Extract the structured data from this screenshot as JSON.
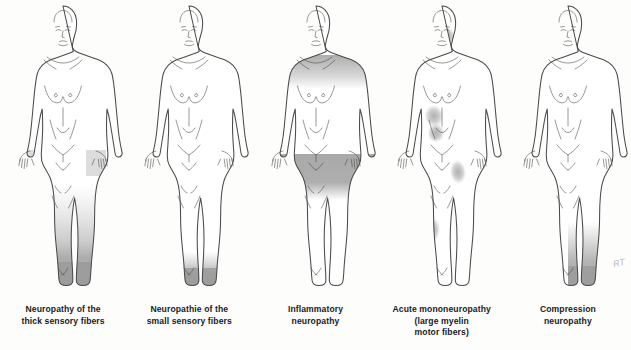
{
  "figure": {
    "background_color": "#fdfdfc",
    "outline_color": "#4a4a4a",
    "shade_color": "#9a9a9a",
    "signature": "RT"
  },
  "panels": [
    {
      "id": "thick-sensory-fibers",
      "caption_lines": [
        "Neuropathy of the",
        "thick sensory fibers"
      ],
      "pattern": "stocking-glove, symmetric distal",
      "regions": [
        "both hands",
        "both lower legs gradient",
        "both feet solid"
      ]
    },
    {
      "id": "small-sensory-fibers",
      "caption_lines": [
        "Neuropathie of the",
        "small sensory fibers"
      ],
      "pattern": "short stocking, symmetric distal",
      "regions": [
        "both feet",
        "both ankles"
      ]
    },
    {
      "id": "inflammatory-neuropathy",
      "caption_lines": [
        "Inflammatory",
        "neuropathy"
      ],
      "pattern": "proximal, symmetric",
      "regions": [
        "both shoulders",
        "both upper arms",
        "both thighs band"
      ]
    },
    {
      "id": "acute-mononeuropathy",
      "caption_lines": [
        "Acute mononeuropathy",
        "(large myelin",
        "motor fibers)"
      ],
      "pattern": "multifocal, asymmetric patches",
      "regions": [
        "left cheek",
        "left upper abdomen",
        "left lower abdomen",
        "right thigh",
        "left calf"
      ]
    },
    {
      "id": "compression-neuropathy",
      "caption_lines": [
        "Compression",
        "neuropathy"
      ],
      "pattern": "unilateral distal",
      "regions": [
        "right lower leg",
        "right foot"
      ]
    }
  ]
}
